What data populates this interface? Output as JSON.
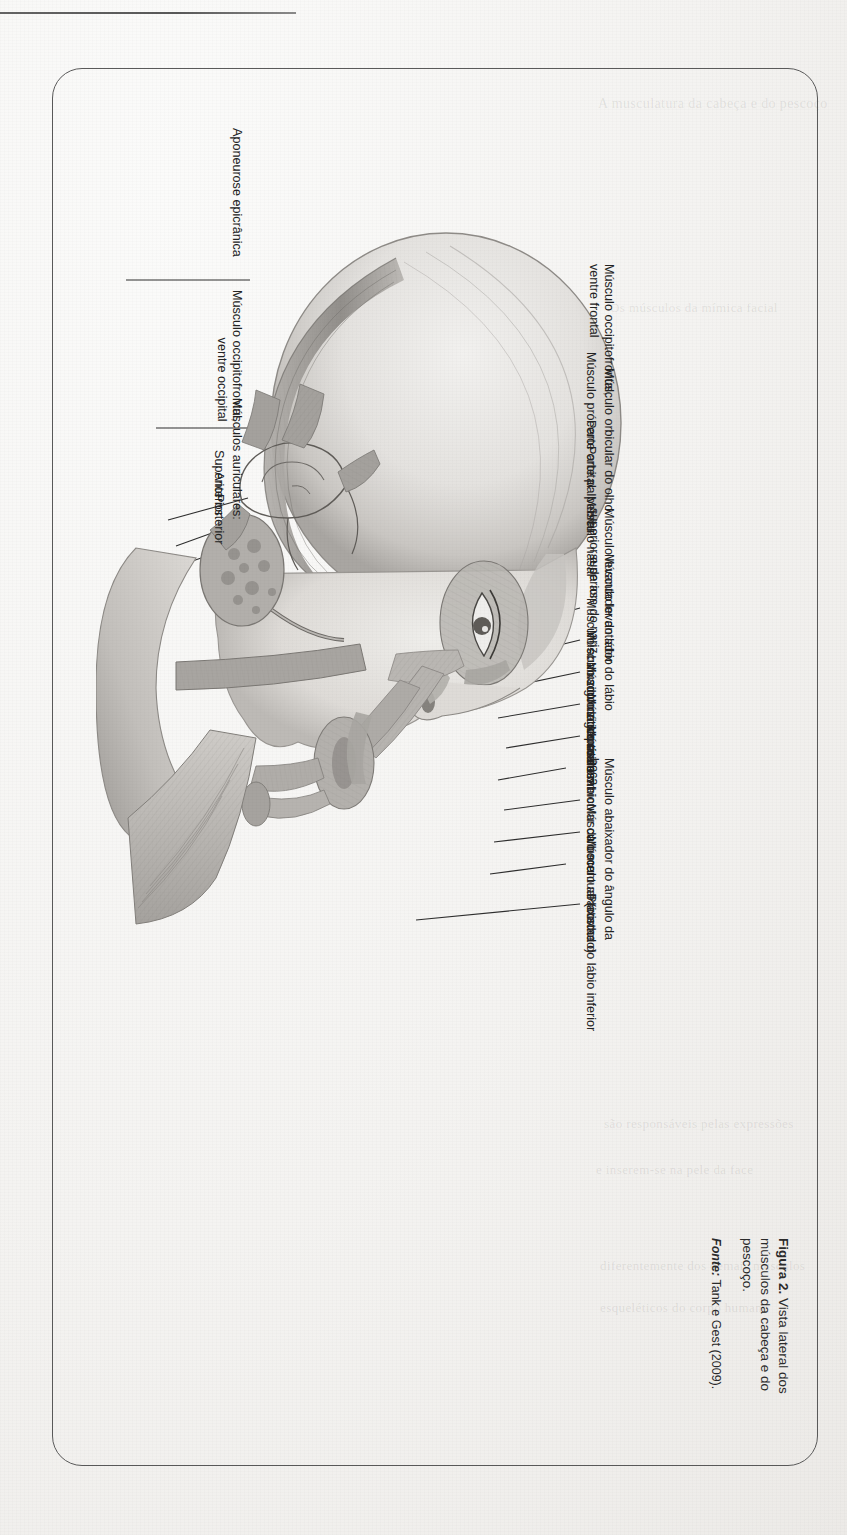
{
  "page": {
    "background_color": "#f3f2f0",
    "ink_color": "#232323",
    "frame_color": "#5a5a5a"
  },
  "caption": {
    "figure_number": "Figura 2.",
    "text": " Vista lateral dos músculos da cabeça e do pescoço.",
    "source_label": "Fonte:",
    "source_text": " Tank e Gest (2009)."
  },
  "figure": {
    "title": "Vista lateral dos músculos da cabeça e do pescoço",
    "style": "pencil-shaded anatomical illustration, grayscale"
  },
  "labels_top": [
    {
      "id": "occipitofrontal-frontal",
      "lines": [
        "Músculo occipitofrontal,",
        "ventre frontal"
      ]
    },
    {
      "id": "procero",
      "lines": [
        "Músculo prócero"
      ]
    },
    {
      "id": "orbicular-olho",
      "lines": [
        "Músculo orbicular do olho:"
      ]
    },
    {
      "id": "parte-orbital",
      "lines": [
        "Parte orbital"
      ]
    },
    {
      "id": "parte-palpebral",
      "lines": [
        "Parte palpebral"
      ]
    },
    {
      "id": "nasal",
      "lines": [
        "Músculo nasal"
      ]
    },
    {
      "id": "levantador-labio-sup-asa-nariz",
      "lines": [
        "Músculo levantador do lábio",
        "superior e da asa do nariz"
      ]
    },
    {
      "id": "levantador-labio-sup",
      "lines": [
        "Músculo levantador do lábio",
        "superior"
      ]
    },
    {
      "id": "abaixador-septo-nasal",
      "lines": [
        "Músculo abaixador do septo nasal"
      ]
    },
    {
      "id": "zigomatico-menor",
      "lines": [
        "Músculo zigomático menor"
      ]
    },
    {
      "id": "zigomatico-maior",
      "lines": [
        "Músculo zigomático maior"
      ]
    },
    {
      "id": "risorio",
      "lines": [
        "Músculo risório"
      ]
    },
    {
      "id": "orbicular-boca",
      "lines": [
        "Músculo orbicular da boca"
      ]
    },
    {
      "id": "abaixador-angulo-boca",
      "lines": [
        "Músculo abaixador do ângulo da",
        "boca"
      ]
    },
    {
      "id": "mentual",
      "lines": [
        "Músculo mentual (cortado)"
      ]
    },
    {
      "id": "abaixador-labio-inferior",
      "lines": [
        "Músculo abaixador do lábio inferior"
      ]
    },
    {
      "id": "platisma",
      "lines": [
        "Platisma"
      ]
    }
  ],
  "labels_bottom": [
    {
      "id": "aponeurose-epicranica",
      "lines": [
        "Aponeurose epicrânica"
      ]
    },
    {
      "id": "occipitofrontal-occipital",
      "lines": [
        "Músculo occipitofrontal,",
        "ventre occipital"
      ]
    },
    {
      "id": "auriculares",
      "lines": [
        "Músculos auriculares:"
      ]
    },
    {
      "id": "auricular-superior",
      "lines": [
        "Superior"
      ]
    },
    {
      "id": "auricular-anterior",
      "lines": [
        "Anterior"
      ]
    },
    {
      "id": "auricular-posterior",
      "lines": [
        "Posterior"
      ]
    }
  ],
  "ghost_text": {
    "note": "faint bleed-through text from reverse of scanned page (illegible)",
    "lines": [
      "A musculatura da cabeça e do pescoço",
      "Os músculos da mímica facial",
      "são responsáveis pelas expressões",
      "e inserem-se na pele da face",
      "diferentemente dos demais músculos",
      "esqueléticos do corpo humano"
    ]
  }
}
